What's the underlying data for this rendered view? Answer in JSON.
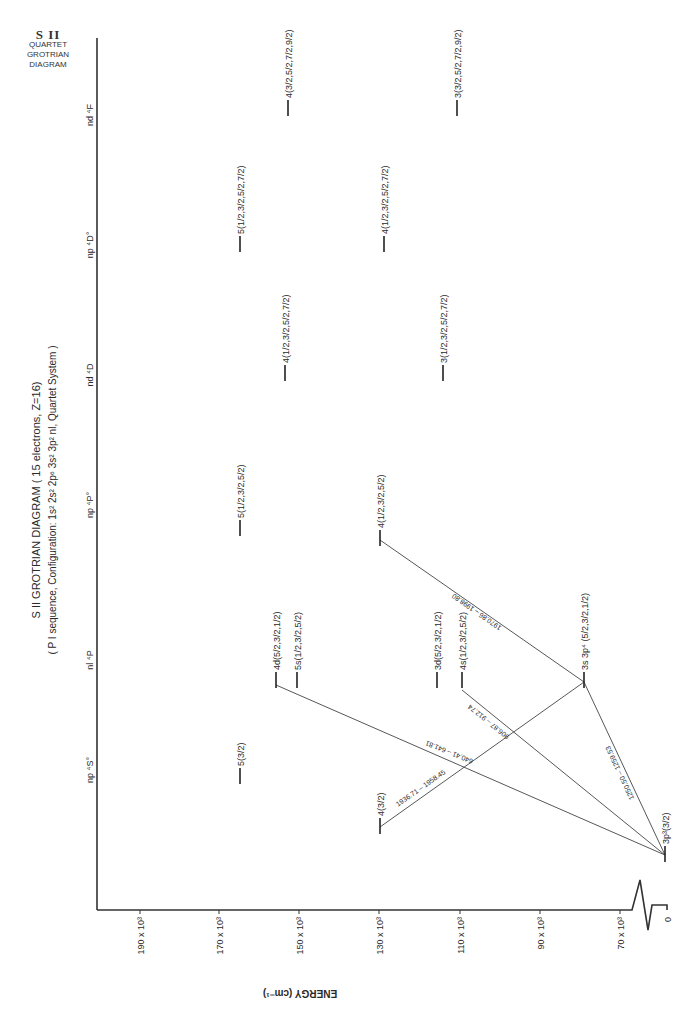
{
  "corner_label": {
    "ion": "S II",
    "line1": "QUARTET",
    "line2": "GROTRIAN",
    "line3": "DIAGRAM"
  },
  "title": {
    "main": "S II  GROTRIAN  DIAGRAM  ( 15 electrons, Z=16)",
    "sub": "( P I  sequence, Configuration: 1s² 2s² 2p⁶ 3s² 3p² nl,  Quartet  System )"
  },
  "axis": {
    "label": "ENERGY   (cm⁻¹)",
    "ticks": [
      "190 x 10³",
      "170 x 10³",
      "150 x 10³",
      "130 x 10³",
      "110 x 10³",
      "90 x 10³",
      "70 x 10³",
      "0"
    ]
  },
  "columns": [
    {
      "id": "S",
      "label": "np ⁴S°"
    },
    {
      "id": "P",
      "label": "nl ⁴P"
    },
    {
      "id": "Po",
      "label": "np ⁴P°"
    },
    {
      "id": "D",
      "label": "nd ⁴D"
    },
    {
      "id": "Do",
      "label": "np ⁴D°"
    },
    {
      "id": "F",
      "label": "nd ⁴F"
    }
  ],
  "levels": [
    {
      "id": "S5",
      "column": "np ⁴S°",
      "label": "5(3/2)"
    },
    {
      "id": "S4",
      "column": "np ⁴S°",
      "label": "4(3/2)"
    },
    {
      "id": "P4d",
      "column": "nl ⁴P",
      "label": "4d(5/2,3/2,1/2)"
    },
    {
      "id": "P5s",
      "column": "nl ⁴P",
      "label": "5s(1/2,3/2,5/2)"
    },
    {
      "id": "P3d",
      "column": "nl ⁴P",
      "label": "3d(5/2,3/2,1/2)"
    },
    {
      "id": "P4s",
      "column": "nl ⁴P",
      "label": "4s(1/2,3/2,5/2)"
    },
    {
      "id": "P3s3p4",
      "column": "nl ⁴P",
      "label": "3s 3p⁴ (5/2,3/2,1/2)"
    },
    {
      "id": "G",
      "column": "np ⁴S°",
      "label": "3p³(3/2)"
    },
    {
      "id": "Po5",
      "column": "np ⁴P°",
      "label": "5(1/2,3/2,5/2)"
    },
    {
      "id": "Po4",
      "column": "np ⁴P°",
      "label": "4(1/2,3/2,5/2)"
    },
    {
      "id": "D4",
      "column": "nd ⁴D",
      "label": "4(1/2,3/2,5/2,7/2)"
    },
    {
      "id": "D3",
      "column": "nd ⁴D",
      "label": "3(1/2,3/2,5/2,7/2)"
    },
    {
      "id": "Do5",
      "column": "np ⁴D°",
      "label": "5(1/2,3/2,5/2,7/2)"
    },
    {
      "id": "Do4",
      "column": "np ⁴D°",
      "label": "4(1/2,3/2,5/2,7/2)"
    },
    {
      "id": "F4",
      "column": "nd ⁴F",
      "label": "4(3/2,5/2,7/2,9/2)"
    },
    {
      "id": "F3",
      "column": "nd ⁴F",
      "label": "3(3/2,5/2,7/2,9/2)"
    }
  ],
  "transitions": [
    {
      "from": "4d(5/2,3/2,1/2)",
      "to": "3p³(3/2)",
      "label": "640.41 – 641.81"
    },
    {
      "from": "4s(1/2,3/2,5/2)",
      "to": "3p³(3/2)",
      "label": "906.87 – 912.74"
    },
    {
      "from": "3s 3p⁴ (5/2,3/2,1/2)",
      "to": "3p³(3/2)",
      "label": "1250.50 – 1259.53"
    },
    {
      "from": "4(3/2) ⁴S°",
      "to": "3s 3p⁴ (5/2,3/2,1/2)",
      "label": "1936.71 – 1958.45"
    },
    {
      "from": "4(1/2,3/2,5/2) ⁴P°",
      "to": "3s 3p⁴ (5/2,3/2,1/2)",
      "label": "1970.86 – 1998.80"
    }
  ],
  "colors": {
    "line": "#333333",
    "text": "#2a2a2a",
    "background": "#ffffff"
  }
}
